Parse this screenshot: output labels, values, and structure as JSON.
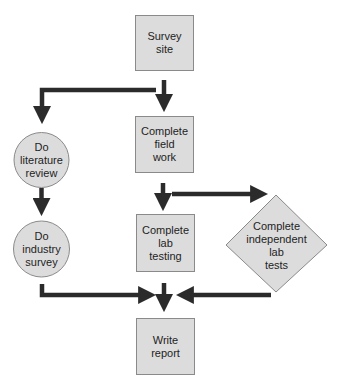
{
  "diagram": {
    "type": "flowchart",
    "colors": {
      "node_fill": "#dcdcdc",
      "node_border": "#8a8a8a",
      "arrow": "#2b2b2b",
      "background": "#ffffff"
    },
    "nodes": [
      {
        "id": "survey-site",
        "shape": "rectangle",
        "label": "Survey\nsite"
      },
      {
        "id": "complete-field-work",
        "shape": "rectangle",
        "label": "Complete\nfield\nwork"
      },
      {
        "id": "do-literature-review",
        "shape": "circle",
        "label": "Do\nliterature\nreview"
      },
      {
        "id": "do-industry-survey",
        "shape": "circle",
        "label": "Do\nindustry\nsurvey"
      },
      {
        "id": "complete-lab-testing",
        "shape": "rectangle",
        "label": "Complete\nlab\ntesting"
      },
      {
        "id": "complete-independent-lab-tests",
        "shape": "diamond",
        "label": "Complete\nindependent\nlab\ntests"
      },
      {
        "id": "write-report",
        "shape": "rectangle",
        "label": "Write\nreport"
      }
    ],
    "edges": [
      {
        "from": "survey-site",
        "to": "complete-field-work"
      },
      {
        "from": "survey-site",
        "to": "do-literature-review"
      },
      {
        "from": "do-literature-review",
        "to": "do-industry-survey"
      },
      {
        "from": "complete-field-work",
        "to": "complete-lab-testing"
      },
      {
        "from": "complete-field-work",
        "to": "complete-independent-lab-tests"
      },
      {
        "from": "complete-lab-testing",
        "to": "write-report"
      },
      {
        "from": "do-industry-survey",
        "to": "write-report"
      },
      {
        "from": "complete-independent-lab-tests",
        "to": "write-report"
      }
    ]
  }
}
